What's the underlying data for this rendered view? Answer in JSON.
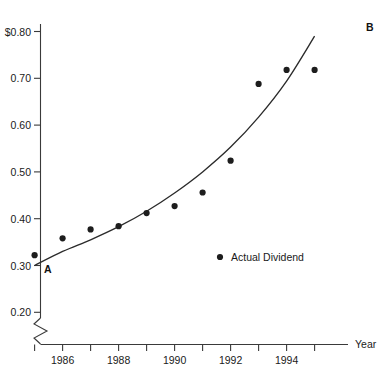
{
  "chart_data": {
    "type": "scatter",
    "title": "",
    "xlabel": "Year",
    "ylabel": "",
    "x": [
      1985,
      1986,
      1987,
      1988,
      1989,
      1990,
      1991,
      1992,
      1993,
      1994,
      1995
    ],
    "values": [
      0.322,
      0.358,
      0.377,
      0.384,
      0.412,
      0.427,
      0.456,
      0.524,
      0.688,
      0.718,
      0.718
    ],
    "series": [
      {
        "name": "Actual Dividend",
        "values": [
          0.322,
          0.358,
          0.377,
          0.384,
          0.412,
          0.427,
          0.456,
          0.524,
          0.688,
          0.718,
          0.718
        ]
      },
      {
        "name": "Trend line A to B",
        "x": [
          1985,
          1986,
          1987,
          1988,
          1989,
          1990,
          1991,
          1992,
          1993,
          1994,
          1995
        ],
        "values": [
          0.3,
          0.33,
          0.355,
          0.383,
          0.416,
          0.455,
          0.5,
          0.553,
          0.617,
          0.694,
          0.79
        ]
      }
    ],
    "ylim": [
      0.2,
      0.8
    ],
    "xlim": [
      1985,
      1995
    ],
    "ytick_labels": [
      "$0.80",
      "0.70",
      "0.60",
      "0.50",
      "0.40",
      "0.30",
      "0.20"
    ],
    "ytick_values": [
      0.8,
      0.7,
      0.6,
      0.5,
      0.4,
      0.3,
      0.2
    ],
    "xtick_values": [
      1985,
      1986,
      1987,
      1988,
      1989,
      1990,
      1991,
      1992,
      1993,
      1994,
      1995
    ],
    "xtick_labels": [
      "",
      "1986",
      "",
      "1988",
      "",
      "1990",
      "",
      "1992",
      "",
      "1994",
      ""
    ],
    "grid": false,
    "axis_break": true,
    "legend": {
      "position": "inside-center",
      "entries": [
        {
          "marker": "filled-circle",
          "label": "Actual Dividend"
        }
      ]
    },
    "annotations": [
      {
        "name": "curve-start",
        "label": "A",
        "x": 1985,
        "y": 0.3
      },
      {
        "name": "curve-end",
        "label": "B",
        "x": 1995,
        "y": 0.79
      }
    ],
    "colors": {
      "axis": "#3a3a3a",
      "curve": "#2b2b2b",
      "marker": "#1d1d1d",
      "text": "#1a1a1a",
      "background": "#ffffff"
    }
  },
  "axis": {
    "x_title": "Year",
    "y_ticks": [
      {
        "label": "$0.80",
        "value": 0.8
      },
      {
        "label": "0.70",
        "value": 0.7
      },
      {
        "label": "0.60",
        "value": 0.6
      },
      {
        "label": "0.50",
        "value": 0.5
      },
      {
        "label": "0.40",
        "value": 0.4
      },
      {
        "label": "0.30",
        "value": 0.3
      },
      {
        "label": "0.20",
        "value": 0.2
      }
    ],
    "x_ticks": [
      {
        "label": "1986",
        "value": 1986
      },
      {
        "label": "1988",
        "value": 1988
      },
      {
        "label": "1990",
        "value": 1990
      },
      {
        "label": "1992",
        "value": 1992
      },
      {
        "label": "1994",
        "value": 1994
      }
    ]
  },
  "legend": {
    "label": "Actual Dividend"
  },
  "annotations": {
    "start_label": "A",
    "end_label": "B"
  }
}
